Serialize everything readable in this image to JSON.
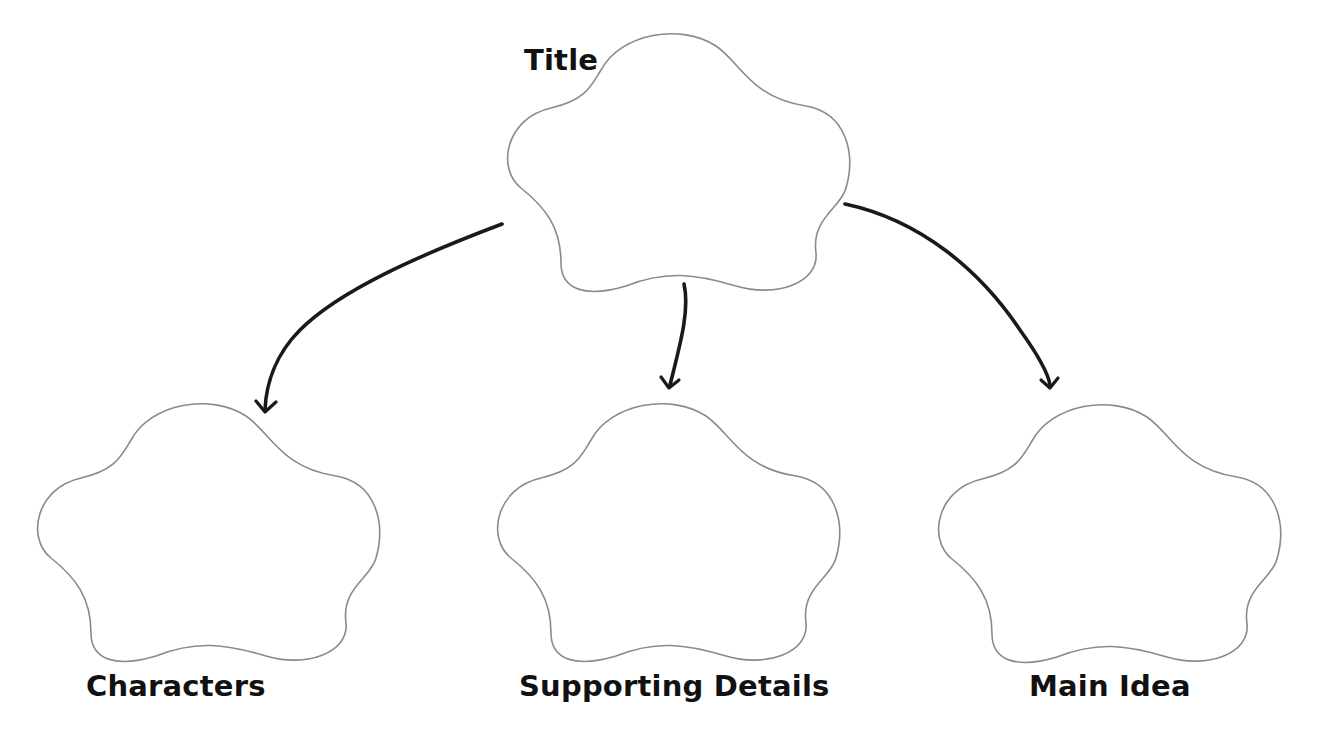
{
  "diagram": {
    "type": "graphic-organizer",
    "colors": {
      "background": "#ffffff",
      "outline": "#8a8a8a",
      "arrow": "#1a1a1a",
      "text": "#111111"
    },
    "nodes": [
      {
        "id": "title",
        "label": "Title",
        "position": "top-center"
      },
      {
        "id": "characters",
        "label": "Characters",
        "position": "bottom-left"
      },
      {
        "id": "supporting_details",
        "label": "Supporting Details",
        "position": "bottom-center"
      },
      {
        "id": "main_idea",
        "label": "Main Idea",
        "position": "bottom-right"
      }
    ],
    "edges": [
      {
        "from": "title",
        "to": "characters"
      },
      {
        "from": "title",
        "to": "supporting_details"
      },
      {
        "from": "title",
        "to": "main_idea"
      }
    ]
  }
}
